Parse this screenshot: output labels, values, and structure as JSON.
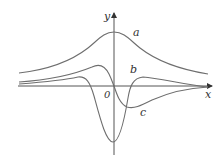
{
  "diagram": {
    "axes": {
      "x_label": "x",
      "y_label": "y",
      "origin_label": "0"
    },
    "curves": [
      {
        "id": "a",
        "label": "a",
        "shape": "bell-shaped curve, always positive, peak on y-axis"
      },
      {
        "id": "b",
        "label": "b",
        "shape": "small positive hump left, deep negative minimum at origin, small positive hump right"
      },
      {
        "id": "c",
        "label": "c",
        "shape": "positive hump left of origin, crosses zero at origin, negative minimum right of origin"
      }
    ]
  }
}
